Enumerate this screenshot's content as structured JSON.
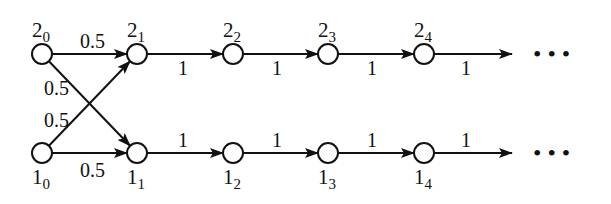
{
  "diagram": {
    "title": "",
    "nodes": [
      {
        "id": "2_0",
        "base": "2",
        "sub": "0",
        "x": 42,
        "y": 54,
        "label_pos": "above"
      },
      {
        "id": "2_1",
        "base": "2",
        "sub": "1",
        "x": 137,
        "y": 54,
        "label_pos": "above"
      },
      {
        "id": "2_2",
        "base": "2",
        "sub": "2",
        "x": 233,
        "y": 54,
        "label_pos": "above"
      },
      {
        "id": "2_3",
        "base": "2",
        "sub": "3",
        "x": 328,
        "y": 54,
        "label_pos": "above"
      },
      {
        "id": "2_4",
        "base": "2",
        "sub": "4",
        "x": 424,
        "y": 54,
        "label_pos": "above"
      },
      {
        "id": "1_0",
        "base": "1",
        "sub": "0",
        "x": 42,
        "y": 153,
        "label_pos": "below"
      },
      {
        "id": "1_1",
        "base": "1",
        "sub": "1",
        "x": 137,
        "y": 153,
        "label_pos": "below"
      },
      {
        "id": "1_2",
        "base": "1",
        "sub": "2",
        "x": 233,
        "y": 153,
        "label_pos": "below"
      },
      {
        "id": "1_3",
        "base": "1",
        "sub": "3",
        "x": 328,
        "y": 153,
        "label_pos": "below"
      },
      {
        "id": "1_4",
        "base": "1",
        "sub": "4",
        "x": 424,
        "y": 153,
        "label_pos": "below"
      }
    ],
    "edges": [
      {
        "from": "2_0",
        "to": "2_1",
        "weight": "0.5",
        "lx": 80,
        "ly": 48
      },
      {
        "from": "2_0",
        "to": "1_1",
        "weight": "0.5",
        "lx": 44,
        "ly": 95
      },
      {
        "from": "1_0",
        "to": "2_1",
        "weight": "0.5",
        "lx": 44,
        "ly": 127
      },
      {
        "from": "1_0",
        "to": "1_1",
        "weight": "0.5",
        "lx": 80,
        "ly": 177
      },
      {
        "from": "2_1",
        "to": "2_2",
        "weight": "1",
        "lx": 178,
        "ly": 75
      },
      {
        "from": "2_2",
        "to": "2_3",
        "weight": "1",
        "lx": 272,
        "ly": 75
      },
      {
        "from": "2_3",
        "to": "2_4",
        "weight": "1",
        "lx": 367,
        "ly": 75
      },
      {
        "from": "2_4",
        "to": "out_top",
        "weight": "1",
        "lx": 461,
        "ly": 75
      },
      {
        "from": "1_1",
        "to": "1_2",
        "weight": "1",
        "lx": 178,
        "ly": 147
      },
      {
        "from": "1_2",
        "to": "1_3",
        "weight": "1",
        "lx": 272,
        "ly": 147
      },
      {
        "from": "1_3",
        "to": "1_4",
        "weight": "1",
        "lx": 367,
        "ly": 147
      },
      {
        "from": "1_4",
        "to": "out_bottom",
        "weight": "1",
        "lx": 461,
        "ly": 147
      }
    ],
    "continuation": "• • •"
  }
}
